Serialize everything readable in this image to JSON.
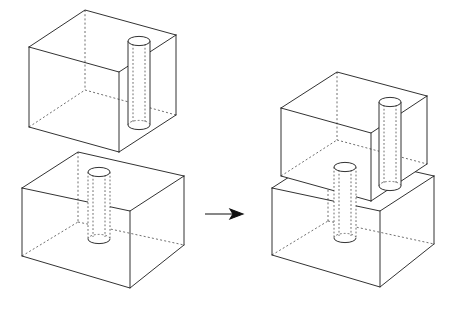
{
  "figure": {
    "type": "technical-line-drawing",
    "background_color": "#ffffff",
    "line_color": "#1b1b1b",
    "hidden_line_color": "#4a4a4a",
    "hidden_line_style": "dashed",
    "projection": "oblique-wireframe",
    "caption": ""
  },
  "arrow": {
    "name": "transformation-arrow",
    "direction": "right",
    "color": "#111111",
    "label": "",
    "from_x": 205,
    "to_x": 243,
    "y": 214
  },
  "groups": [
    {
      "id": "left-exploded-view",
      "label": "Exploded view: two separate boxes",
      "parts": [
        {
          "id": "upper-box-left",
          "label": "Upper box with through hole",
          "hole_count": 1,
          "hole_position": "right-of-center"
        },
        {
          "id": "lower-box-left",
          "label": "Lower box with through hole",
          "hole_count": 1,
          "hole_position": "center"
        }
      ]
    },
    {
      "id": "right-assembled-view",
      "label": "Assembled view: boxes stacked together",
      "parts": [
        {
          "id": "upper-box-right",
          "label": "Upper box seated on lower box",
          "hole_count": 1,
          "hole_position": "right-of-center"
        },
        {
          "id": "lower-box-right",
          "label": "Lower box supporting upper box",
          "hole_count": 1,
          "hole_position": "center"
        }
      ]
    }
  ],
  "cylinders": [
    {
      "id": "cyl-upper-left",
      "label": "Hole through upper left box"
    },
    {
      "id": "cyl-lower-left",
      "label": "Hole through lower left box"
    },
    {
      "id": "cyl-upper-right",
      "label": "Hole through upper right box"
    },
    {
      "id": "cyl-lower-right",
      "label": "Hole through lower right box"
    }
  ]
}
